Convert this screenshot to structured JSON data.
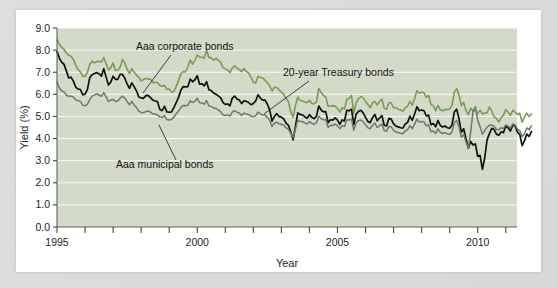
{
  "figure": {
    "background_color": "#d9dcd8",
    "card_color": "#ffffff",
    "plot_background_color": "#d3dbc8"
  },
  "chart_data": {
    "type": "line",
    "title": "",
    "subtitle": "",
    "xlabel": "Year",
    "ylabel": "Yield (%)",
    "xlim": [
      1995,
      2011.4
    ],
    "ylim": [
      0.0,
      9.0
    ],
    "grid": true,
    "grid_color": "#ffffff",
    "legend_position": "inline-annotations",
    "x_tick_labels": [
      "1995",
      "2000",
      "2005",
      "2010"
    ],
    "x_tick_values": [
      1995,
      2000,
      2005,
      2010
    ],
    "x_minor_tick_values": [
      1995,
      1996,
      1997,
      1998,
      1999,
      2000,
      2001,
      2002,
      2003,
      2004,
      2005,
      2006,
      2007,
      2008,
      2009,
      2010,
      2011
    ],
    "y_tick_labels": [
      "0.0",
      "1.0",
      "2.0",
      "3.0",
      "4.0",
      "5.0",
      "6.0",
      "7.0",
      "8.0",
      "9.0"
    ],
    "y_tick_values": [
      0.0,
      1.0,
      2.0,
      3.0,
      4.0,
      5.0,
      6.0,
      7.0,
      8.0,
      9.0
    ],
    "annotations": [
      {
        "name": "aaa-corporate-bonds",
        "text": "Aaa corporate bonds",
        "text_x": 120,
        "text_y": 40,
        "leader": [
          [
            155,
            45
          ],
          [
            127,
            83
          ]
        ]
      },
      {
        "name": "twenty-year-treasury-bonds",
        "text": "20-year Treasury bonds",
        "text_x": 267,
        "text_y": 66,
        "leader": [
          [
            293,
            71
          ],
          [
            248,
            104
          ]
        ]
      },
      {
        "name": "aaa-municipal-bonds",
        "text": "Aaa municipal bonds",
        "text_x": 100,
        "text_y": 158,
        "leader": [
          [
            160,
            150
          ],
          [
            143,
            115
          ]
        ]
      }
    ],
    "series": [
      {
        "name": "Aaa corporate bonds",
        "color": "#7a9b52",
        "width": 1.6,
        "x_start": 1995.0,
        "x_step": 0.08333,
        "values": [
          8.46,
          8.26,
          8.12,
          8.03,
          7.86,
          7.77,
          7.72,
          7.57,
          7.32,
          7.12,
          7.02,
          6.82,
          6.81,
          6.99,
          7.35,
          7.5,
          7.43,
          7.48,
          7.5,
          7.46,
          7.66,
          7.39,
          7.1,
          7.2,
          7.42,
          7.08,
          7.09,
          7.22,
          7.58,
          7.41,
          7.14,
          6.94,
          7.16,
          7.0,
          6.87,
          6.76,
          6.61,
          6.67,
          6.72,
          6.69,
          6.69,
          6.53,
          6.55,
          6.52,
          6.4,
          6.37,
          6.41,
          6.22,
          6.24,
          6.1,
          6.13,
          6.36,
          6.62,
          6.93,
          7.03,
          7.01,
          7.26,
          7.55,
          7.36,
          7.55,
          7.78,
          7.68,
          7.68,
          7.64,
          7.99,
          7.67,
          7.65,
          7.55,
          7.62,
          7.55,
          7.45,
          7.21,
          7.15,
          7.1,
          6.98,
          7.2,
          7.29,
          7.18,
          7.13,
          7.02,
          7.17,
          7.03,
          6.97,
          6.77,
          6.55,
          6.51,
          6.81,
          6.76,
          6.75,
          6.63,
          6.53,
          6.37,
          6.15,
          6.32,
          6.31,
          6.21,
          6.1,
          6.0,
          5.81,
          5.67,
          5.22,
          4.97,
          5.49,
          5.88,
          5.72,
          5.7,
          5.65,
          5.62,
          5.73,
          5.59,
          5.57,
          5.64,
          6.27,
          6.08,
          5.95,
          5.88,
          5.46,
          5.47,
          5.49,
          5.47,
          5.36,
          5.2,
          5.4,
          5.33,
          5.78,
          5.82,
          5.95,
          5.13,
          5.63,
          5.8,
          5.9,
          5.84,
          5.68,
          5.54,
          5.39,
          5.61,
          5.68,
          5.51,
          5.68,
          5.79,
          5.37,
          5.33,
          5.62,
          5.62,
          5.4,
          5.39,
          5.33,
          5.29,
          5.25,
          5.39,
          5.46,
          5.68,
          5.51,
          5.8,
          6.17,
          6.05,
          6.1,
          6.08,
          5.86,
          5.96,
          5.54,
          5.49,
          5.26,
          5.5,
          5.3,
          5.26,
          5.31,
          5.31,
          5.34,
          5.5,
          6.1,
          6.26,
          5.96,
          5.49,
          5.63,
          5.27,
          5.08,
          5.37,
          5.24,
          5.27,
          5.14,
          5.28,
          5.11,
          5.16,
          5.16,
          5.42,
          5.25,
          4.98,
          4.91,
          4.75,
          4.94,
          5.05,
          5.31,
          5.19,
          5.05,
          5.28,
          5.2,
          5.1,
          5.14,
          4.74,
          4.97,
          5.15,
          5.0,
          5.12
        ]
      },
      {
        "name": "20-year Treasury bonds",
        "color": "#111111",
        "width": 1.7,
        "x_start": 1995.0,
        "x_step": 0.08333,
        "values": [
          7.93,
          7.64,
          7.45,
          7.36,
          7.06,
          6.74,
          6.78,
          6.6,
          6.33,
          6.24,
          6.22,
          5.98,
          6.01,
          6.21,
          6.75,
          6.89,
          6.94,
          6.98,
          6.93,
          6.82,
          7.16,
          6.79,
          6.42,
          6.55,
          6.82,
          6.68,
          6.68,
          6.9,
          6.9,
          6.74,
          6.47,
          6.27,
          6.52,
          6.35,
          6.16,
          5.88,
          5.84,
          5.82,
          5.94,
          5.95,
          5.85,
          5.74,
          5.7,
          5.67,
          5.31,
          5.26,
          5.46,
          5.21,
          5.19,
          5.21,
          5.4,
          5.62,
          5.86,
          6.19,
          6.35,
          6.34,
          6.35,
          6.69,
          6.57,
          6.66,
          6.84,
          6.46,
          6.48,
          6.38,
          6.57,
          6.21,
          6.17,
          6.06,
          6.0,
          5.93,
          5.85,
          5.64,
          5.54,
          5.57,
          5.48,
          5.83,
          5.92,
          5.79,
          5.74,
          5.58,
          5.71,
          5.68,
          5.63,
          5.53,
          5.59,
          5.7,
          5.98,
          5.83,
          5.74,
          5.74,
          5.55,
          5.3,
          4.79,
          5.0,
          5.13,
          5.0,
          4.97,
          4.89,
          4.7,
          4.6,
          4.31,
          3.94,
          4.54,
          5.16,
          5.09,
          5.07,
          4.99,
          4.92,
          5.08,
          4.96,
          4.9,
          5.01,
          5.47,
          5.29,
          5.21,
          5.22,
          4.72,
          4.85,
          4.83,
          4.93,
          4.83,
          4.64,
          4.84,
          4.8,
          5.28,
          5.26,
          5.33,
          4.63,
          5.11,
          5.23,
          5.28,
          5.16,
          4.96,
          4.77,
          4.72,
          4.95,
          5.09,
          4.81,
          4.93,
          5.04,
          4.6,
          4.57,
          4.91,
          4.88,
          4.66,
          4.56,
          4.53,
          4.49,
          4.47,
          4.66,
          4.73,
          5.01,
          4.83,
          5.11,
          5.44,
          5.26,
          5.29,
          5.26,
          5.02,
          5.06,
          4.63,
          4.68,
          4.53,
          4.82,
          4.59,
          4.52,
          4.57,
          4.49,
          4.47,
          4.61,
          5.2,
          5.33,
          4.89,
          4.28,
          4.44,
          3.98,
          3.56,
          3.87,
          3.71,
          3.76,
          3.2,
          3.24,
          2.61,
          3.12,
          3.94,
          4.22,
          4.46,
          4.41,
          4.2,
          4.15,
          4.3,
          4.27,
          4.56,
          4.48,
          4.34,
          4.61,
          4.57,
          4.29,
          4.18,
          3.68,
          3.9,
          4.2,
          4.1,
          4.32
        ]
      },
      {
        "name": "Aaa municipal bonds",
        "color": "#6b7a69",
        "width": 1.5,
        "x_start": 1995.0,
        "x_step": 0.08333,
        "values": [
          6.56,
          6.3,
          6.15,
          6.11,
          5.97,
          5.91,
          5.92,
          5.88,
          5.75,
          5.71,
          5.68,
          5.51,
          5.48,
          5.55,
          5.75,
          5.92,
          5.96,
          6.02,
          5.97,
          5.91,
          6.08,
          5.89,
          5.68,
          5.74,
          5.77,
          5.68,
          5.7,
          5.82,
          5.92,
          5.83,
          5.67,
          5.53,
          5.68,
          5.52,
          5.4,
          5.24,
          5.18,
          5.17,
          5.22,
          5.25,
          5.19,
          5.12,
          5.11,
          5.07,
          4.98,
          4.95,
          5.04,
          4.86,
          4.84,
          4.86,
          4.97,
          5.12,
          5.24,
          5.4,
          5.5,
          5.48,
          5.51,
          5.7,
          5.63,
          5.69,
          5.82,
          5.63,
          5.61,
          5.55,
          5.72,
          5.47,
          5.45,
          5.38,
          5.36,
          5.3,
          5.22,
          5.08,
          5.04,
          5.07,
          5.02,
          5.2,
          5.26,
          5.19,
          5.16,
          5.04,
          5.15,
          5.11,
          5.09,
          5.01,
          5.0,
          5.03,
          5.2,
          5.12,
          5.06,
          5.06,
          4.96,
          4.82,
          4.55,
          4.69,
          4.74,
          4.66,
          4.65,
          4.6,
          4.48,
          4.42,
          4.25,
          4.03,
          4.42,
          4.83,
          4.78,
          4.76,
          4.71,
          4.66,
          4.77,
          4.69,
          4.65,
          4.72,
          5.01,
          4.9,
          4.85,
          4.86,
          4.5,
          4.6,
          4.59,
          4.65,
          4.58,
          4.44,
          4.58,
          4.55,
          4.85,
          4.84,
          4.88,
          4.37,
          4.72,
          4.81,
          4.84,
          4.76,
          4.62,
          4.49,
          4.45,
          4.6,
          4.7,
          4.5,
          4.58,
          4.65,
          4.36,
          4.33,
          4.55,
          4.53,
          4.37,
          4.3,
          4.27,
          4.24,
          4.22,
          4.35,
          4.4,
          4.58,
          4.45,
          4.65,
          4.88,
          4.75,
          4.77,
          4.75,
          4.58,
          4.61,
          4.31,
          4.34,
          4.23,
          4.44,
          4.28,
          4.23,
          4.27,
          4.21,
          4.2,
          4.3,
          4.72,
          4.82,
          4.52,
          4.06,
          4.18,
          3.84,
          3.56,
          4.3,
          5.25,
          5.45,
          4.82,
          4.54,
          4.2,
          4.36,
          4.52,
          4.6,
          4.62,
          4.55,
          4.42,
          4.39,
          4.49,
          4.45,
          4.62,
          4.56,
          4.47,
          4.66,
          4.62,
          4.43,
          4.35,
          4.08,
          4.22,
          4.48,
          4.4,
          4.58
        ]
      }
    ]
  }
}
